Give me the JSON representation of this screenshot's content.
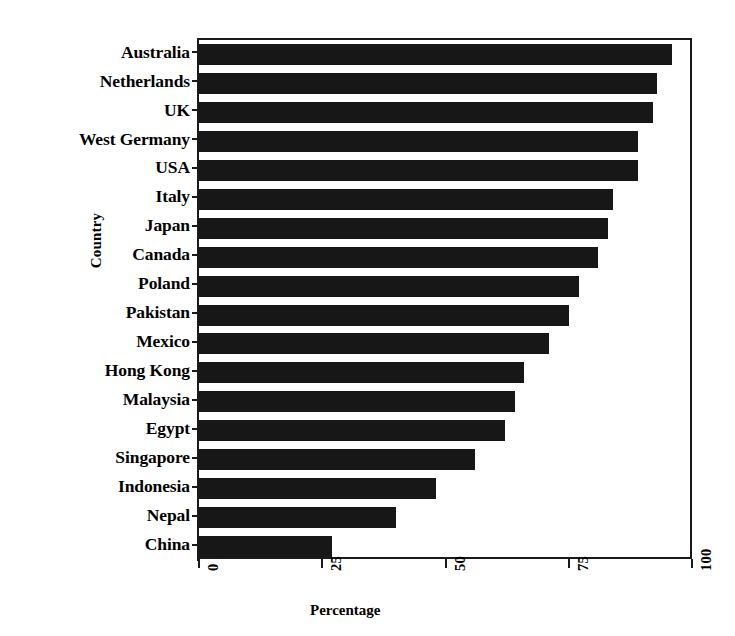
{
  "chart_data": {
    "type": "bar",
    "orientation": "horizontal",
    "title": "",
    "subtitle": "",
    "xlabel": "Percentage",
    "ylabel": "Country",
    "categories": [
      "Australia",
      "Netherlands",
      "UK",
      "West Germany",
      "USA",
      "Italy",
      "Japan",
      "Canada",
      "Poland",
      "Pakistan",
      "Mexico",
      "Hong Kong",
      "Malaysia",
      "Egypt",
      "Singapore",
      "Indonesia",
      "Nepal",
      "China"
    ],
    "values": [
      96,
      93,
      92,
      89,
      89,
      84,
      83,
      81,
      77,
      75,
      71,
      66,
      64,
      62,
      56,
      48,
      40,
      27
    ],
    "xlim": [
      0,
      100
    ],
    "xticks": [
      0,
      25,
      50,
      75,
      100
    ],
    "xtick_labels": [
      "0",
      "25",
      "50",
      "75",
      "100"
    ],
    "xtick_label_rotation": -90,
    "grid": false,
    "legend": false,
    "legend_position": "none",
    "bar_color": "#171717",
    "background_color": "#ffffff",
    "axis_color": "#1a1a1a"
  },
  "axes": {
    "y_title": "Country",
    "x_title": "Percentage"
  }
}
